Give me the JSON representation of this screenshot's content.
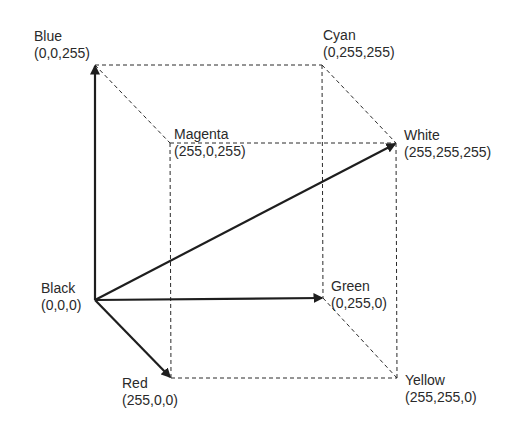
{
  "diagram": {
    "colors": {
      "edge": "#2a2a2a",
      "axis": "#1e1e1e",
      "text": "#2a2a2a",
      "background": "#ffffff"
    },
    "vertices": {
      "black": {
        "name": "Black",
        "rgb": "(0,0,0)",
        "x": 95,
        "y": 300
      },
      "red": {
        "name": "Red",
        "rgb": "(255,0,0)",
        "x": 171,
        "y": 378
      },
      "green": {
        "name": "Green",
        "rgb": "(0,255,0)",
        "x": 323,
        "y": 298
      },
      "yellow": {
        "name": "Yellow",
        "rgb": "(255,255,0)",
        "x": 397,
        "y": 378
      },
      "blue": {
        "name": "Blue",
        "rgb": "(0,0,255)",
        "x": 95,
        "y": 65
      },
      "magenta": {
        "name": "Magenta",
        "rgb": "(255,0,255)",
        "x": 170,
        "y": 143
      },
      "cyan": {
        "name": "Cyan",
        "rgb": "(0,255,255)",
        "x": 322,
        "y": 65
      },
      "white": {
        "name": "White",
        "rgb": "(255,255,255)",
        "x": 396,
        "y": 143
      }
    },
    "arrows": [
      {
        "from": "black",
        "to": "blue",
        "label": "blue axis"
      },
      {
        "from": "black",
        "to": "red",
        "label": "red axis"
      },
      {
        "from": "black",
        "to": "green",
        "label": "green axis"
      },
      {
        "from": "black",
        "to": "white",
        "label": "grayscale diagonal"
      }
    ],
    "dashed_edges": [
      [
        "blue",
        "cyan"
      ],
      [
        "blue",
        "magenta"
      ],
      [
        "cyan",
        "white"
      ],
      [
        "magenta",
        "white"
      ],
      [
        "magenta",
        "red"
      ],
      [
        "cyan",
        "green"
      ],
      [
        "white",
        "yellow"
      ],
      [
        "red",
        "yellow"
      ],
      [
        "green",
        "yellow"
      ]
    ]
  }
}
